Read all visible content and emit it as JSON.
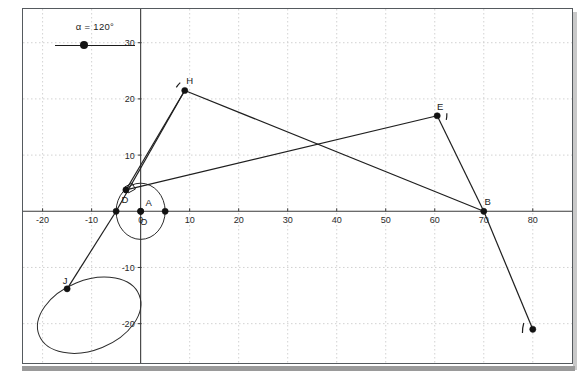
{
  "app": {
    "title": "Geometry construction applet",
    "background": "#ffffff",
    "frame_border_color": "#555a5e"
  },
  "slider": {
    "name": "alpha-slider",
    "label": "α = 120°",
    "variable": "α",
    "value": 120,
    "unit": "°",
    "knob_fraction": 0.36,
    "knob_color": "#141414",
    "track_color": "#1c1c1c"
  },
  "chart_data": {
    "type": "scatter",
    "title": "",
    "xlabel": "",
    "ylabel": "",
    "xlim": [
      -24,
      88
    ],
    "ylim": [
      -27,
      36
    ],
    "grid": true,
    "grid_color": "#c7c7c7",
    "grid_step": 10,
    "axis_color": "#3a3a3a",
    "x_ticks": [
      -20,
      -10,
      0,
      10,
      20,
      30,
      40,
      50,
      60,
      70,
      80
    ],
    "x_tick_labels": [
      "-20",
      "-10",
      "0",
      "10",
      "20",
      "30",
      "40",
      "50",
      "60",
      "70",
      "80"
    ],
    "y_ticks": [
      30,
      20,
      10,
      -10,
      -20
    ],
    "y_tick_labels": [
      "30",
      "20",
      "10",
      "-10",
      "-20"
    ],
    "origin_label": "0",
    "points": [
      {
        "name": "H",
        "label": "H",
        "x": 9.0,
        "y": 21.5,
        "label_dx": 5,
        "label_dy": -6
      },
      {
        "name": "E",
        "label": "E",
        "x": 60.5,
        "y": 17.0,
        "label_dx": 3,
        "label_dy": -6
      },
      {
        "name": "B",
        "label": "B",
        "x": 70.0,
        "y": 0.0,
        "label_dx": 4,
        "label_dy": -6
      },
      {
        "name": "A",
        "label": "A",
        "x": 0.0,
        "y": 0.0,
        "label_dx": 8,
        "label_dy": -5
      },
      {
        "name": "D",
        "label": "D",
        "x": -3.0,
        "y": 3.8,
        "label_dx": -1,
        "label_dy": 13
      },
      {
        "name": "O",
        "label": "O",
        "x": 0.0,
        "y": 0.0,
        "label_dx": 3,
        "label_dy": 14
      },
      {
        "name": "J",
        "label": "J",
        "x": -15.0,
        "y": -13.8,
        "label_dx": -2,
        "label_dy": -5
      },
      {
        "name": "Pleft",
        "label": "",
        "x": -5.0,
        "y": 0.0,
        "label_dx": 0,
        "label_dy": 0
      },
      {
        "name": "Pright",
        "label": "",
        "x": 5.0,
        "y": 0.0,
        "label_dx": 0,
        "label_dy": 0
      },
      {
        "name": "Pbottomright",
        "label": "",
        "x": 80.0,
        "y": -21.0,
        "label_dx": 0,
        "label_dy": 0
      }
    ],
    "segments": [
      {
        "name": "H-to-B",
        "x1": 9.0,
        "y1": 21.5,
        "x2": 70.0,
        "y2": 0.0
      },
      {
        "name": "H-to-D",
        "x1": 9.0,
        "y1": 21.5,
        "x2": -3.0,
        "y2": 3.8
      },
      {
        "name": "D-to-E",
        "x1": -3.0,
        "y1": 3.8,
        "x2": 60.5,
        "y2": 17.0
      },
      {
        "name": "E-to-B",
        "x1": 60.5,
        "y1": 17.0,
        "x2": 70.0,
        "y2": 0.0
      },
      {
        "name": "B-to-bottomright",
        "x1": 70.0,
        "y1": 0.0,
        "x2": 80.0,
        "y2": -21.0
      },
      {
        "name": "leftpoint-to-J",
        "x1": -5.0,
        "y1": 0.0,
        "x2": -15.0,
        "y2": -13.8
      },
      {
        "name": "H-to-leftpoint",
        "x1": 9.0,
        "y1": 21.5,
        "x2": -5.0,
        "y2": 0.0
      }
    ],
    "circle": {
      "name": "unit-circle-A",
      "cx": 0.0,
      "cy": 0.0,
      "r": 5.0
    },
    "ellipse": {
      "name": "ellipse-J",
      "cx": -10.5,
      "cy": -18.5,
      "rx": 11.0,
      "ry": 6.2,
      "rotation_deg": -22
    },
    "arcs": [
      {
        "name": "arc-at-H",
        "x": 9.0,
        "y": 21.5,
        "span_deg": 40,
        "radius": 9,
        "start_deg": 200
      },
      {
        "name": "arc-at-E",
        "x": 60.5,
        "y": 17.0,
        "span_deg": 40,
        "radius": 10,
        "start_deg": -15
      },
      {
        "name": "arc-at-bottomright",
        "x": 80.0,
        "y": -21.0,
        "span_deg": 55,
        "radius": 11,
        "start_deg": 160
      }
    ],
    "right_angle_marker": {
      "name": "right-angle-at-D",
      "x": -3.0,
      "y": 3.8,
      "size": 7
    }
  }
}
